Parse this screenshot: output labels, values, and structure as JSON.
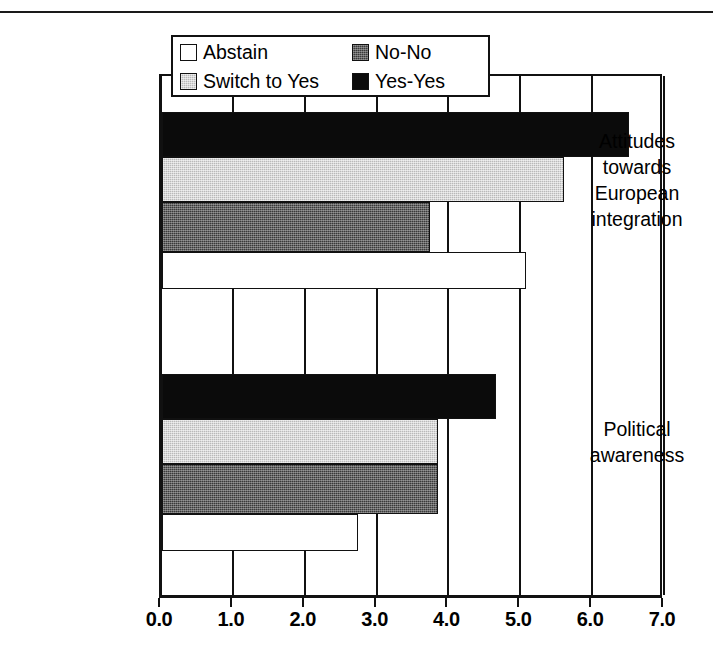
{
  "chart_data": {
    "type": "bar",
    "orientation": "horizontal",
    "title": "",
    "xlabel": "",
    "ylabel": "",
    "xlim": [
      0.0,
      7.0
    ],
    "xticks": [
      "0.0",
      "1.0",
      "2.0",
      "3.0",
      "4.0",
      "5.0",
      "6.0",
      "7.0"
    ],
    "grid": true,
    "legend_position": "top-left-inside",
    "categories": [
      "Attitudes towards European integration",
      "Political awareness"
    ],
    "category_label_lines": [
      [
        "Attitudes",
        "towards",
        "European",
        "integration"
      ],
      [
        "Political",
        "awareness"
      ]
    ],
    "series": [
      {
        "name": "Abstain",
        "swatch": "sw-abstain",
        "color": "#ffffff",
        "values": [
          5.06,
          2.73
        ]
      },
      {
        "name": "No-No",
        "swatch": "sw-nono",
        "color": "#3a3a3a",
        "values": [
          3.73,
          3.84
        ]
      },
      {
        "name": "Switch to Yes",
        "swatch": "sw-switch",
        "color": "#b9b9b9",
        "values": [
          5.6,
          3.84
        ]
      },
      {
        "name": "Yes-Yes",
        "swatch": "sw-yesyes",
        "color": "#0b0b0b",
        "values": [
          6.5,
          4.65
        ]
      }
    ],
    "bar_draw_order_top_to_bottom": [
      "Yes-Yes",
      "Switch to Yes",
      "No-No",
      "Abstain"
    ]
  },
  "legend": {
    "entries": [
      {
        "label": "Abstain",
        "swatch": "sw-abstain"
      },
      {
        "label": "No-No",
        "swatch": "sw-nono"
      },
      {
        "label": "Switch to Yes",
        "swatch": "sw-switch"
      },
      {
        "label": "Yes-Yes",
        "swatch": "sw-yesyes"
      }
    ]
  },
  "axis": {
    "x_tick_labels": [
      "0.0",
      "1.0",
      "2.0",
      "3.0",
      "4.0",
      "5.0",
      "6.0",
      "7.0"
    ]
  },
  "category_labels": [
    {
      "lines": [
        "Attitudes",
        "towards",
        "European",
        "integration"
      ]
    },
    {
      "lines": [
        "Political",
        "awareness"
      ]
    }
  ]
}
